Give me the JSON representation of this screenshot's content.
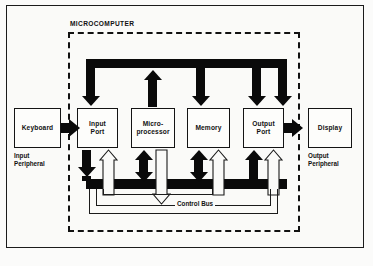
{
  "figure": {
    "boundary_label": "MICROCOMPUTER",
    "caption": ""
  },
  "blocks": [
    {
      "id": "keyboard",
      "label": "Keyboard",
      "caption": "Input\nPeripheral"
    },
    {
      "id": "input-port",
      "label": "Input\nPort",
      "caption": ""
    },
    {
      "id": "microprocessor",
      "label": "Micro-\nprocessor",
      "caption": ""
    },
    {
      "id": "memory",
      "label": "Memory",
      "caption": ""
    },
    {
      "id": "output-port",
      "label": "Output\nPort",
      "caption": ""
    },
    {
      "id": "display",
      "label": "Display",
      "caption": "Output\nPeripheral"
    }
  ],
  "labels": {
    "keyboard": "Keyboard",
    "input_port_line1": "Input",
    "input_port_line2": "Port",
    "micro_line1": "Micro-",
    "micro_line2": "processor",
    "memory": "Memory",
    "output_port_line1": "Output",
    "output_port_line2": "Port",
    "display": "Display",
    "input_peripheral_line1": "Input",
    "input_peripheral_line2": "Peripheral",
    "output_peripheral_line1": "Output",
    "output_peripheral_line2": "Peripheral",
    "control_bus": "Control Bus"
  },
  "buses": [
    {
      "id": "address-bus",
      "style": "solid-black",
      "direction": "from-microprocessor-to-ports-and-memory"
    },
    {
      "id": "data-bus",
      "style": "solid-black",
      "direction": "bidirectional"
    },
    {
      "id": "control-bus",
      "style": "outline",
      "direction": "from-microprocessor-to-ports-and-memory",
      "label": "Control Bus"
    }
  ],
  "colors": {
    "bus": "#0a0a0a",
    "outline": "#141414",
    "background": "#fafaf8",
    "boundary": "#111111"
  }
}
